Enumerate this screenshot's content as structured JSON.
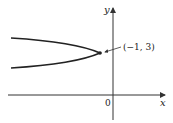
{
  "diagram": {
    "type": "parabola-graph",
    "axes": {
      "x_label": "x",
      "y_label": "y",
      "origin_label": "0"
    },
    "curve": {
      "shape": "parabola opening left",
      "vertex": [
        -1,
        3
      ]
    },
    "annotations": [
      {
        "text": "(−1, 3)",
        "points_to": "vertex"
      }
    ],
    "colors": {
      "axis": "#333333",
      "curve": "#222222",
      "text": "#222222"
    }
  }
}
